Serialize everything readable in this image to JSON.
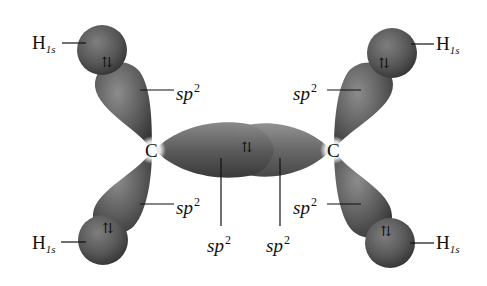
{
  "diagram": {
    "atoms": {
      "carbon_left": "C",
      "carbon_right": "C"
    },
    "labels": {
      "h1s_top_left": {
        "base": "H",
        "sub": "1s"
      },
      "h1s_top_right": {
        "base": "H",
        "sub": "1s"
      },
      "h1s_bottom_left": {
        "base": "H",
        "sub": "1s"
      },
      "h1s_bottom_right": {
        "base": "H",
        "sub": "1s"
      },
      "sp2_top_left": {
        "base": "sp",
        "sup": "2"
      },
      "sp2_top_right": {
        "base": "sp",
        "sup": "2"
      },
      "sp2_bottom_left": {
        "base": "sp",
        "sup": "2"
      },
      "sp2_bottom_right": {
        "base": "sp",
        "sup": "2"
      },
      "sp2_center_left": {
        "base": "sp",
        "sup": "2"
      },
      "sp2_center_right": {
        "base": "sp",
        "sup": "2"
      }
    },
    "electron_pair_symbol": "⇅",
    "colors": {
      "lobe_dark": "#3e3e3e",
      "lobe_mid": "#6a6a6a",
      "lobe_light": "#9a9a9a",
      "background": "#ffffff",
      "text": "#111111"
    }
  }
}
